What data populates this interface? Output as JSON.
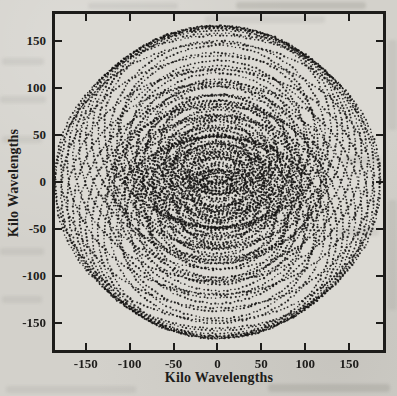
{
  "page": {
    "kind": "scanned journal figure",
    "background_color": "#d3d1cb",
    "plot_background_color": "#dcdad4",
    "ink_color": "#1d1c1a"
  },
  "chart_data": {
    "type": "scatter",
    "subtype": "uv-coverage interferometer tracks (dotted concentric ellipse arcs, conjugate-symmetric)",
    "title": "",
    "xlabel": "Kilo Wavelengths",
    "ylabel": "Kilo Wavelengths",
    "x_ticks": [
      -150,
      -100,
      -50,
      0,
      50,
      100,
      150
    ],
    "x_tick_labels": [
      "-150",
      "-100",
      "-50",
      "0",
      "50",
      "100",
      "150"
    ],
    "y_ticks": [
      -150,
      -100,
      -50,
      0,
      50,
      100,
      150
    ],
    "y_tick_labels": [
      "-150",
      "-100",
      "-50",
      "0",
      "50",
      "100",
      "150"
    ],
    "xlim": [
      -185.0,
      188.5
    ],
    "ylim": [
      -178.7,
      178.7
    ],
    "grid": false,
    "legend": null,
    "axial_ratio": 0.82,
    "seed": 20240711,
    "dot": {
      "spacing_px": 3.8,
      "radius_px": 0.95,
      "color": "#161514",
      "alpha": 0.9
    },
    "tracks_note": "each entry is one baseline track: [u_half_width_kilolambda, v_center_offset_kilolambda]; each track is drawn as a dotted ellipse plus its conjugate (offset mirrored), v_half_width = axial_ratio * u_half_width",
    "tracks": [
      [
        185,
        4
      ],
      [
        178,
        12
      ],
      [
        171,
        21
      ],
      [
        164,
        29
      ],
      [
        157,
        36
      ],
      [
        150,
        43
      ],
      [
        143,
        49
      ],
      [
        136,
        54
      ],
      [
        129,
        58
      ],
      [
        126,
        20
      ],
      [
        122,
        50
      ],
      [
        118,
        10
      ],
      [
        114,
        44
      ],
      [
        110,
        55
      ],
      [
        106,
        15
      ],
      [
        103,
        36
      ],
      [
        99,
        48
      ],
      [
        96,
        8
      ],
      [
        93,
        28
      ],
      [
        90,
        42
      ],
      [
        86,
        12
      ],
      [
        83,
        24
      ],
      [
        80,
        36
      ],
      [
        77,
        46
      ],
      [
        74,
        6
      ],
      [
        71,
        18
      ],
      [
        68,
        30
      ],
      [
        65,
        40
      ],
      [
        62,
        10
      ],
      [
        59,
        22
      ],
      [
        56,
        33
      ],
      [
        53,
        5
      ],
      [
        50,
        15
      ],
      [
        47,
        26
      ],
      [
        44,
        30
      ],
      [
        41,
        9
      ],
      [
        38,
        19
      ],
      [
        35,
        23
      ],
      [
        32,
        5
      ],
      [
        29,
        14
      ],
      [
        26,
        21
      ],
      [
        23,
        9
      ],
      [
        20,
        15
      ],
      [
        17,
        4
      ],
      [
        14,
        9
      ],
      [
        11,
        5
      ]
    ]
  }
}
